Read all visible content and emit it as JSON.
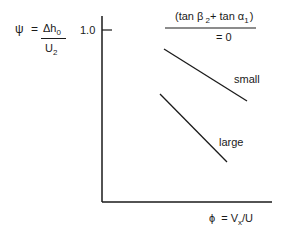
{
  "diagram": {
    "y_axis_label": {
      "psi": "ψ",
      "equals": "=",
      "numerator": "Δh",
      "numerator_sub": "0",
      "denominator": "U",
      "denominator_sub": "2"
    },
    "y_tick_label": "1.0",
    "x_axis_label": {
      "phi": "ϕ",
      "equals": "= V",
      "sub": "x",
      "rest": "/U"
    },
    "legend_header": {
      "open": "(tan β",
      "beta_sub": " 2",
      "mid": "+ tan α",
      "alpha_sub": "1",
      "close": ")",
      "value": "= 0"
    },
    "lines": [
      {
        "label": "small",
        "x1": 164,
        "y1": 49,
        "x2": 247,
        "y2": 101
      },
      {
        "label": "large",
        "x1": 160,
        "y1": 94,
        "x2": 227,
        "y2": 162
      }
    ],
    "colors": {
      "stroke": "#1a1a1a",
      "background": "#ffffff"
    }
  }
}
